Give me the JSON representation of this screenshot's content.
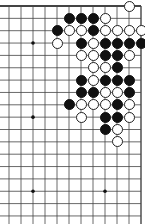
{
  "board": {
    "size": 19,
    "view": {
      "first_col": 7,
      "last_col": 18,
      "first_row": 0,
      "last_row": 17,
      "edges": [
        "top",
        "right"
      ]
    },
    "geometry": {
      "x0": 9,
      "dx": 12,
      "y0": 6,
      "dy": 12.35
    },
    "colors": {
      "background": "#ffffff",
      "line": "#444444",
      "black_stone": "#111111",
      "white_stone": "#ffffff",
      "stone_outline": "#222222"
    },
    "star_points": [
      {
        "col": 9,
        "row": 3
      },
      {
        "col": 15,
        "row": 3
      },
      {
        "col": 9,
        "row": 9
      },
      {
        "col": 15,
        "row": 9
      },
      {
        "col": 9,
        "row": 15
      },
      {
        "col": 15,
        "row": 15
      }
    ],
    "stones": [
      {
        "color": "white",
        "col": 17,
        "row": 0
      },
      {
        "color": "black",
        "col": 12,
        "row": 1
      },
      {
        "color": "black",
        "col": 13,
        "row": 1
      },
      {
        "color": "black",
        "col": 14,
        "row": 1
      },
      {
        "color": "white",
        "col": 15,
        "row": 1
      },
      {
        "color": "black",
        "col": 11,
        "row": 2
      },
      {
        "color": "white",
        "col": 12,
        "row": 2
      },
      {
        "color": "white",
        "col": 13,
        "row": 2
      },
      {
        "color": "black",
        "col": 14,
        "row": 2
      },
      {
        "color": "white",
        "col": 15,
        "row": 2
      },
      {
        "color": "white",
        "col": 16,
        "row": 2
      },
      {
        "color": "white",
        "col": 17,
        "row": 2
      },
      {
        "color": "white",
        "col": 18,
        "row": 2
      },
      {
        "color": "white",
        "col": 11,
        "row": 3
      },
      {
        "color": "black",
        "col": 13,
        "row": 3
      },
      {
        "color": "white",
        "col": 14,
        "row": 3
      },
      {
        "color": "black",
        "col": 15,
        "row": 3
      },
      {
        "color": "black",
        "col": 16,
        "row": 3
      },
      {
        "color": "black",
        "col": 17,
        "row": 3
      },
      {
        "color": "black",
        "col": 18,
        "row": 3
      },
      {
        "color": "white",
        "col": 13,
        "row": 4
      },
      {
        "color": "white",
        "col": 14,
        "row": 4
      },
      {
        "color": "black",
        "col": 15,
        "row": 4
      },
      {
        "color": "black",
        "col": 16,
        "row": 4
      },
      {
        "color": "white",
        "col": 17,
        "row": 4
      },
      {
        "color": "white",
        "col": 14,
        "row": 5
      },
      {
        "color": "white",
        "col": 15,
        "row": 5
      },
      {
        "color": "black",
        "col": 16,
        "row": 5
      },
      {
        "color": "black",
        "col": 13,
        "row": 6
      },
      {
        "color": "white",
        "col": 14,
        "row": 6
      },
      {
        "color": "black",
        "col": 15,
        "row": 6
      },
      {
        "color": "black",
        "col": 16,
        "row": 6
      },
      {
        "color": "black",
        "col": 17,
        "row": 6
      },
      {
        "color": "black",
        "col": 13,
        "row": 7
      },
      {
        "color": "black",
        "col": 14,
        "row": 7
      },
      {
        "color": "white",
        "col": 15,
        "row": 7
      },
      {
        "color": "white",
        "col": 16,
        "row": 7
      },
      {
        "color": "black",
        "col": 17,
        "row": 7
      },
      {
        "color": "black",
        "col": 12,
        "row": 8
      },
      {
        "color": "white",
        "col": 13,
        "row": 8
      },
      {
        "color": "white",
        "col": 14,
        "row": 8
      },
      {
        "color": "white",
        "col": 15,
        "row": 8
      },
      {
        "color": "black",
        "col": 16,
        "row": 8
      },
      {
        "color": "white",
        "col": 17,
        "row": 8
      },
      {
        "color": "white",
        "col": 13,
        "row": 9
      },
      {
        "color": "black",
        "col": 15,
        "row": 9
      },
      {
        "color": "black",
        "col": 16,
        "row": 9
      },
      {
        "color": "white",
        "col": 17,
        "row": 9
      },
      {
        "color": "black",
        "col": 15,
        "row": 10
      },
      {
        "color": "white",
        "col": 16,
        "row": 10
      },
      {
        "color": "white",
        "col": 16,
        "row": 11
      }
    ]
  }
}
